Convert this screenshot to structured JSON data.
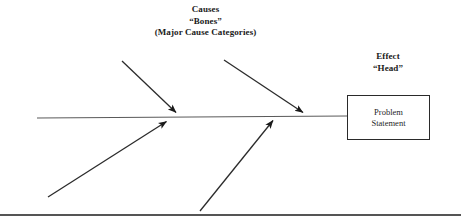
{
  "diagram": {
    "type": "fishbone-cause-and-effect",
    "background_color": "#ffffff",
    "line_color": "#333333",
    "spine_color": "#555555",
    "text_color": "#1a1a1a",
    "labels": {
      "causes": {
        "line1": "Causes",
        "line2": "“Bones”",
        "line3": "(Major Cause Categories)"
      },
      "effect": {
        "line1": "Effect",
        "line2": "“Head”"
      },
      "problem_box": {
        "line1": "Problem",
        "line2": "Statement"
      }
    },
    "spine": {
      "x1": 37,
      "y1": 118,
      "x2": 347,
      "y2": 116
    },
    "bones": [
      {
        "name": "upper-bone-1",
        "x1": 122,
        "y1": 61,
        "x2": 178,
        "y2": 114,
        "arrow": "end"
      },
      {
        "name": "upper-bone-2",
        "x1": 224,
        "y1": 60,
        "x2": 305,
        "y2": 114,
        "arrow": "end"
      },
      {
        "name": "lower-bone-1",
        "x1": 48,
        "y1": 197,
        "x2": 165,
        "y2": 120,
        "arrow": "end"
      },
      {
        "name": "lower-bone-2",
        "x1": 200,
        "y1": 211,
        "x2": 272,
        "y2": 119,
        "arrow": "end"
      }
    ],
    "bottom_rule": {
      "x1": 0,
      "y1": 215,
      "x2": 461,
      "y2": 215
    }
  }
}
